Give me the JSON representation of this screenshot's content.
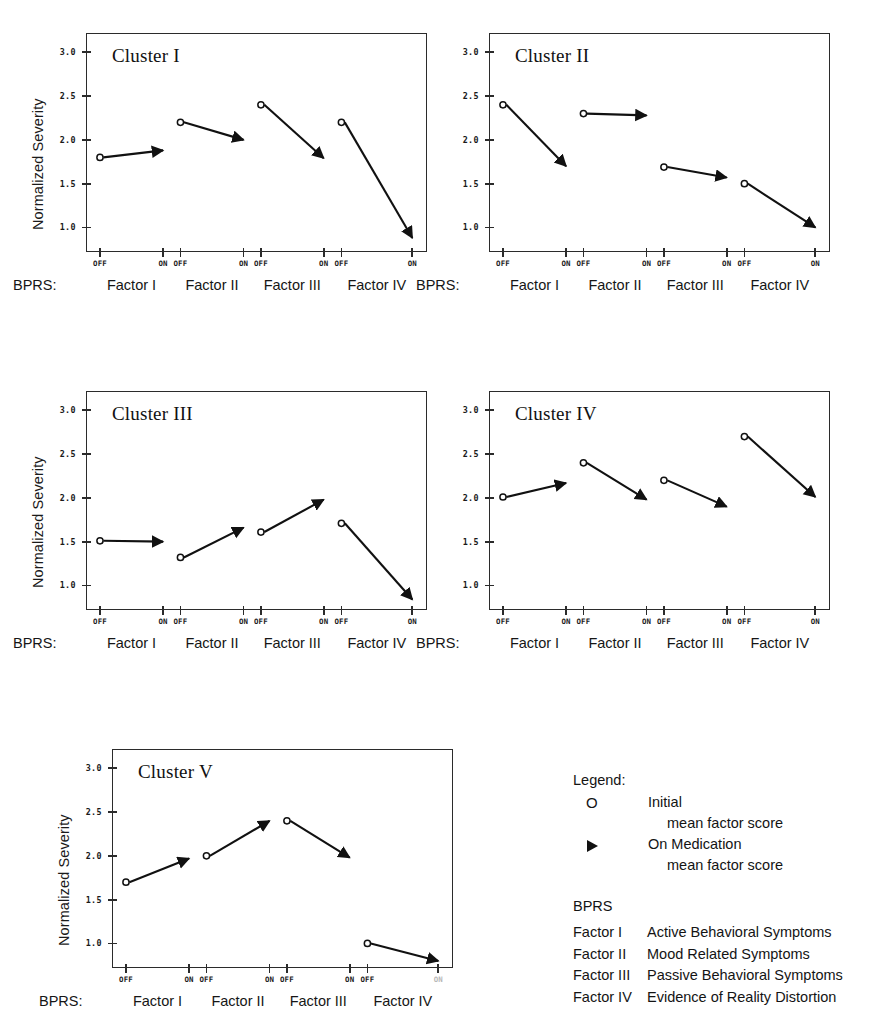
{
  "axis": {
    "y_title": "Normalized Severity",
    "y_ticks": [
      "3.0",
      "2.5",
      "2.0",
      "1.5",
      "1.0"
    ],
    "y_tick_values": [
      3.0,
      2.5,
      2.0,
      1.5,
      1.0
    ],
    "ylim": [
      0.72,
      3.22
    ],
    "x_tick_labels": [
      "OFF",
      "ON",
      "OFF",
      "ON",
      "OFF",
      "ON",
      "OFF",
      "ON"
    ],
    "bprs_prefix": "BPRS:",
    "factor_bands": [
      "Factor I",
      "Factor II",
      "Factor III",
      "Factor IV"
    ]
  },
  "legend": {
    "heading": "Legend:",
    "initial_marker": "O",
    "initial_label_line1": "Initial",
    "initial_label_line2": "mean factor score",
    "medication_marker": "triangle-right",
    "medication_label_line1": "On Medication",
    "medication_label_line2": "mean factor score",
    "bprs_heading": "BPRS",
    "bprs_factors": [
      {
        "name": "Factor I",
        "desc": "Active Behavioral Symptoms"
      },
      {
        "name": "Factor II",
        "desc": "Mood Related Symptoms"
      },
      {
        "name": "Factor III",
        "desc": "Passive Behavioral Symptoms"
      },
      {
        "name": "Factor IV",
        "desc": "Evidence of Reality Distortion"
      }
    ]
  },
  "chart_data": [
    {
      "type": "line",
      "title": "Cluster I",
      "xlabel": "",
      "ylabel": "Normalized Severity",
      "ylim": [
        0.72,
        3.22
      ],
      "categories": [
        "Factor I",
        "Factor II",
        "Factor III",
        "Factor IV"
      ],
      "series": [
        {
          "name": "Initial mean factor score",
          "values": [
            1.8,
            2.2,
            2.4,
            2.2
          ]
        },
        {
          "name": "On Medication mean factor score",
          "values": [
            1.88,
            2.0,
            1.79,
            0.88
          ]
        }
      ]
    },
    {
      "type": "line",
      "title": "Cluster II",
      "xlabel": "",
      "ylabel": "Normalized Severity",
      "ylim": [
        0.72,
        3.22
      ],
      "categories": [
        "Factor I",
        "Factor II",
        "Factor III",
        "Factor IV"
      ],
      "series": [
        {
          "name": "Initial mean factor score",
          "values": [
            2.4,
            2.3,
            1.69,
            1.5
          ]
        },
        {
          "name": "On Medication mean factor score",
          "values": [
            1.7,
            2.28,
            1.57,
            1.0
          ]
        }
      ]
    },
    {
      "type": "line",
      "title": "Cluster III",
      "xlabel": "",
      "ylabel": "Normalized Severity",
      "ylim": [
        0.72,
        3.22
      ],
      "categories": [
        "Factor I",
        "Factor II",
        "Factor III",
        "Factor IV"
      ],
      "series": [
        {
          "name": "Initial mean factor score",
          "values": [
            1.51,
            1.32,
            1.61,
            1.71
          ]
        },
        {
          "name": "On Medication mean factor score",
          "values": [
            1.5,
            1.66,
            1.98,
            0.84
          ]
        }
      ]
    },
    {
      "type": "line",
      "title": "Cluster IV",
      "xlabel": "",
      "ylabel": "Normalized Severity",
      "ylim": [
        0.72,
        3.22
      ],
      "categories": [
        "Factor I",
        "Factor II",
        "Factor III",
        "Factor IV"
      ],
      "series": [
        {
          "name": "Initial mean factor score",
          "values": [
            2.01,
            2.4,
            2.2,
            2.7
          ]
        },
        {
          "name": "On Medication mean factor score",
          "values": [
            2.17,
            1.98,
            1.9,
            2.01
          ]
        }
      ]
    },
    {
      "type": "line",
      "title": "Cluster V",
      "xlabel": "",
      "ylabel": "Normalized Severity",
      "ylim": [
        0.72,
        3.22
      ],
      "categories": [
        "Factor I",
        "Factor II",
        "Factor III",
        "Factor IV"
      ],
      "series": [
        {
          "name": "Initial mean factor score",
          "values": [
            1.7,
            2.0,
            2.4,
            1.0
          ]
        },
        {
          "name": "On Medication mean factor score",
          "values": [
            1.97,
            2.4,
            1.98,
            0.8
          ]
        }
      ]
    }
  ],
  "panels": [
    {
      "id": "cluster-1",
      "left": 86,
      "top": 33,
      "width": 341,
      "height": 219,
      "chart_index": 0,
      "show_ytitle": true,
      "faded_last_on": false
    },
    {
      "id": "cluster-2",
      "left": 489,
      "top": 33,
      "width": 341,
      "height": 219,
      "chart_index": 1,
      "show_ytitle": false,
      "faded_last_on": false
    },
    {
      "id": "cluster-3",
      "left": 86,
      "top": 391,
      "width": 341,
      "height": 219,
      "chart_index": 2,
      "show_ytitle": true,
      "faded_last_on": false
    },
    {
      "id": "cluster-4",
      "left": 489,
      "top": 391,
      "width": 341,
      "height": 219,
      "chart_index": 3,
      "show_ytitle": false,
      "faded_last_on": false
    },
    {
      "id": "cluster-5",
      "left": 112,
      "top": 749,
      "width": 341,
      "height": 219,
      "chart_index": 4,
      "show_ytitle": true,
      "faded_last_on": true
    }
  ],
  "colors": {
    "ink": "#111111",
    "axis": "#2b2b2b",
    "background": "#ffffff",
    "faded": "#b8b8b8"
  }
}
